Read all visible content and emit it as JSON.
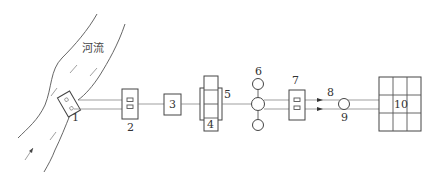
{
  "diagram": {
    "type": "water supply system schematic",
    "river_label": "河流",
    "components": [
      {
        "id": "1",
        "label": "1",
        "description": "intake structure at river bank"
      },
      {
        "id": "2",
        "label": "2",
        "description": "pump station box with two pumps"
      },
      {
        "id": "3",
        "label": "3",
        "description": "box"
      },
      {
        "id": "4",
        "label": "4",
        "description": "stacked tank units"
      },
      {
        "id": "5",
        "label": "5",
        "description": "enclosure around stacked units"
      },
      {
        "id": "6",
        "label": "6",
        "description": "circular tank (top)"
      },
      {
        "id": "7",
        "label": "7",
        "description": "pump station box with two pumps"
      },
      {
        "id": "8",
        "label": "8",
        "description": "twin pipelines with flow arrows"
      },
      {
        "id": "9",
        "label": "9",
        "description": "circle on pipeline"
      },
      {
        "id": "10",
        "label": "10",
        "description": "3x3 grid distribution network"
      }
    ],
    "colors": {
      "line": "#555555",
      "background": "#ffffff"
    }
  }
}
